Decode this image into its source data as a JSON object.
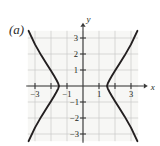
{
  "figure": {
    "panel_label": "(a)",
    "axis_labels": {
      "x": "x",
      "y": "y"
    },
    "colors": {
      "curve": "#231f20",
      "axis": "#3a3a3a",
      "grid": "#c9c9c9",
      "plot_background": "#f7f7f5",
      "text": "#231f20"
    }
  },
  "chart_data": {
    "type": "line",
    "title": "",
    "xlabel": "x",
    "ylabel": "y",
    "xlim": [
      -3.6,
      3.9
    ],
    "ylim": [
      -3.6,
      3.6
    ],
    "grid": true,
    "legend": null,
    "xticks": [
      -3,
      -1,
      1,
      3
    ],
    "xtick_labels": [
      "−3",
      "−1",
      "1",
      "3"
    ],
    "yticks": [
      3,
      2,
      1,
      -1,
      -2,
      -3
    ],
    "ytick_labels": [
      "3",
      "2",
      "1",
      "−1",
      "−2",
      "−3"
    ],
    "grid_x": [
      -3,
      -2,
      -1,
      0,
      1,
      2,
      3
    ],
    "grid_y": [
      -3,
      -2,
      -1,
      0,
      1,
      2,
      3
    ],
    "series": [
      {
        "name": "right-branch",
        "points": [
          [
            3.4,
            3.45
          ],
          [
            3.0,
            2.6
          ],
          [
            2.6,
            1.9
          ],
          [
            2.25,
            1.35
          ],
          [
            2.0,
            0.95
          ],
          [
            1.8,
            0.62
          ],
          [
            1.65,
            0.36
          ],
          [
            1.55,
            0.16
          ],
          [
            1.5,
            0.0
          ],
          [
            1.55,
            -0.16
          ],
          [
            1.65,
            -0.36
          ],
          [
            1.8,
            -0.62
          ],
          [
            2.0,
            -0.95
          ],
          [
            2.25,
            -1.35
          ],
          [
            2.6,
            -1.9
          ],
          [
            3.0,
            -2.6
          ],
          [
            3.4,
            -3.45
          ]
        ]
      },
      {
        "name": "left-branch",
        "points": [
          [
            -3.4,
            3.45
          ],
          [
            -3.0,
            2.6
          ],
          [
            -2.6,
            1.9
          ],
          [
            -2.25,
            1.35
          ],
          [
            -2.0,
            0.95
          ],
          [
            -1.8,
            0.62
          ],
          [
            -1.65,
            0.36
          ],
          [
            -1.55,
            0.16
          ],
          [
            -1.5,
            0.0
          ],
          [
            -1.55,
            -0.16
          ],
          [
            -1.65,
            -0.36
          ],
          [
            -1.8,
            -0.62
          ],
          [
            -2.0,
            -0.95
          ],
          [
            -2.25,
            -1.35
          ],
          [
            -2.6,
            -1.9
          ],
          [
            -3.0,
            -2.6
          ],
          [
            -3.4,
            -3.45
          ]
        ]
      }
    ]
  }
}
